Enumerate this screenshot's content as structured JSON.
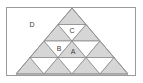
{
  "figure": {
    "title": "",
    "type": "geometric-diagram",
    "frame": {
      "x": 6,
      "y": 7,
      "width": 130,
      "height": 69,
      "stroke": "#9a9a9a",
      "fill": "#ffffff"
    },
    "colors": {
      "shaded_fill": "#d6d6d6",
      "light_fill": "#ffffff",
      "stroke": "#8c8c8c",
      "label_color": "#3a3a3a",
      "frame_stroke": "#9a9a9a",
      "background": "#ffffff"
    },
    "big_triangle": {
      "apex": [
        72,
        8
      ],
      "left": [
        16,
        74
      ],
      "right": [
        128,
        74
      ],
      "rows": 4
    },
    "labels": [
      {
        "id": "label-d",
        "text": "D",
        "x": 32,
        "y": 24,
        "region": "outside-triangle-upper-left"
      },
      {
        "id": "label-c",
        "text": "C",
        "x": 72,
        "y": 30,
        "region": "row-2-up-triangle-center"
      },
      {
        "id": "label-b",
        "text": "B",
        "x": 59,
        "y": 48,
        "region": "row-3-up-triangle-left-center"
      },
      {
        "id": "label-a",
        "text": "A",
        "x": 73,
        "y": 51,
        "region": "row-3-up-triangle-right-center"
      }
    ],
    "shading": {
      "up_triangles": "shaded",
      "down_triangles": "light",
      "note": "Upward-pointing sub-triangles are gray filled; downward-pointing sub-triangles are white."
    }
  }
}
